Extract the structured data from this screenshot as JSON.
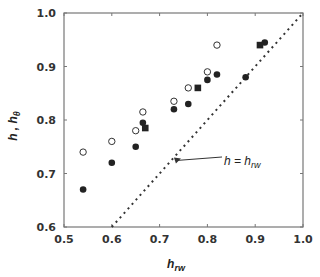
{
  "chart_data": {
    "type": "scatter",
    "title": "",
    "xlabel": "h_rw",
    "ylabel": "h, h_θ",
    "xlim": [
      0.5,
      1.0
    ],
    "ylim": [
      0.6,
      1.0
    ],
    "xticks": [
      "0.5",
      "0.6",
      "0.7",
      "0.8",
      "0.9",
      "1.0"
    ],
    "yticks": [
      "0.6",
      "0.7",
      "0.8",
      "0.9",
      "1.0"
    ],
    "grid": false,
    "legend": null,
    "series": [
      {
        "name": "open circles",
        "marker": "circle-open",
        "points": [
          [
            0.54,
            0.74
          ],
          [
            0.6,
            0.76
          ],
          [
            0.65,
            0.78
          ],
          [
            0.665,
            0.815
          ],
          [
            0.73,
            0.835
          ],
          [
            0.76,
            0.86
          ],
          [
            0.8,
            0.89
          ],
          [
            0.82,
            0.94
          ]
        ]
      },
      {
        "name": "filled circles",
        "marker": "circle-filled",
        "points": [
          [
            0.54,
            0.67
          ],
          [
            0.6,
            0.72
          ],
          [
            0.65,
            0.75
          ],
          [
            0.665,
            0.795
          ],
          [
            0.73,
            0.82
          ],
          [
            0.76,
            0.83
          ],
          [
            0.8,
            0.875
          ],
          [
            0.82,
            0.885
          ],
          [
            0.88,
            0.88
          ],
          [
            0.92,
            0.945
          ]
        ]
      },
      {
        "name": "filled squares",
        "marker": "square-filled",
        "points": [
          [
            0.67,
            0.785
          ],
          [
            0.78,
            0.86
          ],
          [
            0.91,
            0.94
          ]
        ]
      },
      {
        "name": "h = h_rw",
        "marker": "dotted-line",
        "points": [
          [
            0.6,
            0.6
          ],
          [
            1.0,
            1.0
          ]
        ]
      }
    ],
    "annotations": [
      {
        "text": "h = h_rw",
        "main": "h = h",
        "sub": "rw",
        "arrow_to": [
          0.73,
          0.73
        ],
        "text_pos": [
          0.78,
          0.66
        ]
      }
    ]
  },
  "labels": {
    "y_main": "h , h",
    "y_sub": "θ",
    "x_main": "h",
    "x_sub": "rw",
    "annot_main": "h = h",
    "annot_sub": "rw"
  }
}
